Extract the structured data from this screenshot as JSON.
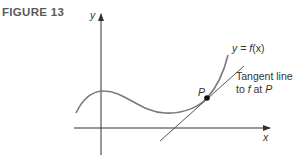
{
  "figure": {
    "label": "FIGURE 13"
  },
  "axes": {
    "x_label": "x",
    "y_label": "y"
  },
  "curve": {
    "label_prefix": "y = ",
    "label_func": "f",
    "label_arg": "(x)"
  },
  "point": {
    "label": "P"
  },
  "tangent": {
    "line1": "Tangent line",
    "line2_prefix": "to ",
    "line2_func": "f",
    "line2_mid": " at ",
    "line2_point": "P"
  },
  "colors": {
    "axis": "#333333",
    "curve": "#7a7a7a",
    "tangent": "#555555",
    "point": "#111111",
    "label": "#5a5a5a"
  }
}
